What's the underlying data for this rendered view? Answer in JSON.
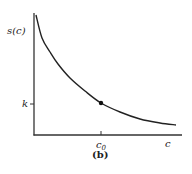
{
  "chart_data": {
    "type": "line",
    "title": "",
    "caption": "(b)",
    "xlabel": "c",
    "ylabel": "s(c)",
    "grid": false,
    "legend": null,
    "x_ticks": [
      {
        "label": "c0",
        "sub": "0",
        "base": "c"
      }
    ],
    "y_ticks": [
      {
        "label": "k"
      }
    ],
    "series": [
      {
        "name": "s(c)",
        "description": "decreasing convex curve (hyperbola-like)",
        "points_px": [
          [
            36,
            15
          ],
          [
            42,
            38
          ],
          [
            50,
            52
          ],
          [
            58,
            64
          ],
          [
            70,
            78
          ],
          [
            85,
            91
          ],
          [
            101,
            103
          ],
          [
            120,
            112
          ],
          [
            140,
            119
          ],
          [
            160,
            123
          ],
          [
            176,
            125
          ]
        ]
      }
    ],
    "marked_point": {
      "x_label": "c0",
      "y_label": "k",
      "px": [
        101,
        103
      ]
    }
  },
  "labels": {
    "y_axis": "s(c)",
    "x_axis": "c",
    "k_tick": "k",
    "c0_base": "c",
    "c0_sub": "0",
    "caption": "(b)"
  }
}
